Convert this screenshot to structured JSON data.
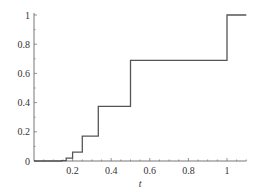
{
  "chart_data": {
    "type": "line",
    "style": "step",
    "title": "",
    "xlabel": "t",
    "ylabel": "",
    "xlim": [
      0,
      1.1
    ],
    "ylim": [
      0,
      1
    ],
    "grid": false,
    "legend": null,
    "x_ticks": [
      0.2,
      0.4,
      0.6,
      0.8,
      1
    ],
    "x_tick_labels": [
      "0.2",
      "0.4",
      "0.6",
      "0.8",
      "1"
    ],
    "y_ticks": [
      0,
      0.2,
      0.4,
      0.6,
      0.8,
      1
    ],
    "y_tick_labels": [
      "0",
      "0.2",
      "0.4",
      "0.6",
      "0.8",
      "1"
    ],
    "series": [
      {
        "name": "step function",
        "color": "#555555",
        "points": [
          {
            "x": 0.0,
            "y": 0.0
          },
          {
            "x": 0.143,
            "y": 0.0
          },
          {
            "x": 0.143,
            "y": 0.003
          },
          {
            "x": 0.167,
            "y": 0.003
          },
          {
            "x": 0.167,
            "y": 0.02
          },
          {
            "x": 0.2,
            "y": 0.02
          },
          {
            "x": 0.2,
            "y": 0.06
          },
          {
            "x": 0.25,
            "y": 0.06
          },
          {
            "x": 0.25,
            "y": 0.17
          },
          {
            "x": 0.333,
            "y": 0.17
          },
          {
            "x": 0.333,
            "y": 0.375
          },
          {
            "x": 0.5,
            "y": 0.375
          },
          {
            "x": 0.5,
            "y": 0.69
          },
          {
            "x": 1.0,
            "y": 0.69
          },
          {
            "x": 1.0,
            "y": 1.0
          },
          {
            "x": 1.1,
            "y": 1.0
          }
        ]
      }
    ]
  }
}
